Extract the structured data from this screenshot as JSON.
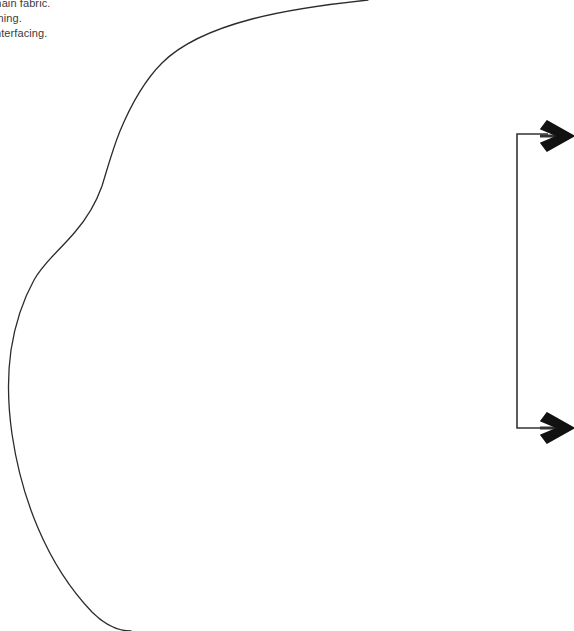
{
  "document": {
    "kind": "sewing-pattern-piece-sheet",
    "background_color": "#ffffff",
    "width": 574,
    "height": 631
  },
  "cutting_note": {
    "name": "cutting-instructions",
    "lines": [
      "1 main fabric.",
      "1 lining.",
      "1 interfacing."
    ],
    "text_color": "#3b3b3b",
    "font_size_px": 11,
    "line_height_px": 15,
    "clipped_at_left_edge": true
  },
  "pattern_outline": {
    "name": "pattern-piece-curve",
    "stroke_color": "#2b2b2b",
    "stroke_width_px": 1.3,
    "fill": "none",
    "description": "Single open curved cutting line with an S-bend on the left side, entering at the top edge and exiting at the bottom edge.",
    "path": "M 368 0 C 330 4 286 10 252 19 C 214 29 182 43 162 63 C 143 82 130 107 120 131 C 112 151 107 170 102 186 C 96 203 88 217 75 232 C 60 250 44 262 34 280 C 22 302 15 324 11 350 C 7 378 8 406 12 434 C 17 468 26 500 38 528 C 52 561 70 589 92 612 C 104 624 118 631 131 631",
    "entry_point": [
      368,
      0
    ],
    "exit_point": [
      131,
      631
    ],
    "leftmost_point": [
      9,
      380
    ]
  },
  "measurement_bracket": {
    "name": "measurement-bracket",
    "stroke_color": "#333333",
    "stroke_width_px": 1.6,
    "fill": "none",
    "corner_top": [
      517,
      134
    ],
    "corner_bottom": [
      517,
      428
    ],
    "vertical_x": 517,
    "arm_end_x": 548,
    "path": "M 548 134 L 517 134 L 517 428 L 548 428"
  },
  "arrows": [
    {
      "name": "arrow-right-top",
      "shape": "chevron-arrowhead",
      "direction": "right",
      "color": "#111111",
      "tip": [
        574,
        136
      ],
      "center_y": 136,
      "width_px": 30,
      "height_px": 30
    },
    {
      "name": "arrow-right-bottom",
      "shape": "chevron-arrowhead",
      "direction": "right",
      "color": "#111111",
      "tip": [
        574,
        428
      ],
      "center_y": 428,
      "width_px": 30,
      "height_px": 30
    }
  ],
  "colors": {
    "page_background": "#ffffff",
    "line_art": "#2b2b2b",
    "arrow_fill": "#111111",
    "note_text": "#3b3b3b"
  }
}
